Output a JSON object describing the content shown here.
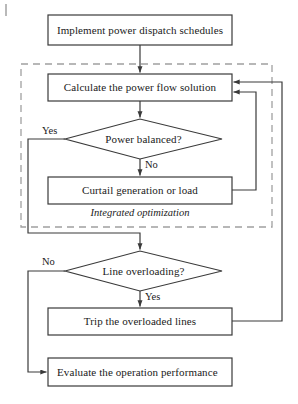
{
  "diagram": {
    "title": "Implement power dispatch schedules",
    "colors": {
      "stroke": "#3a3a3a",
      "dashed_group": "#a0a0a0",
      "text": "#1a1a1a",
      "background": "#ffffff"
    },
    "group": {
      "label": "Integrated optimization"
    },
    "nodes": [
      {
        "id": "implement",
        "type": "process",
        "label": "Implement power dispatch schedules"
      },
      {
        "id": "calculate",
        "type": "process",
        "label": "Calculate the power flow solution"
      },
      {
        "id": "balanced",
        "type": "decision",
        "label": "Power balanced?"
      },
      {
        "id": "curtail",
        "type": "process",
        "label": "Curtail generation or load"
      },
      {
        "id": "overload",
        "type": "decision",
        "label": "Line overloading?"
      },
      {
        "id": "trip",
        "type": "process",
        "label": "Trip the overloaded lines"
      },
      {
        "id": "evaluate",
        "type": "process",
        "label": "Evaluate the operation performance"
      }
    ],
    "edge_labels": {
      "balanced_yes": "Yes",
      "balanced_no": "No",
      "overload_no": "No",
      "overload_yes": "Yes"
    }
  }
}
